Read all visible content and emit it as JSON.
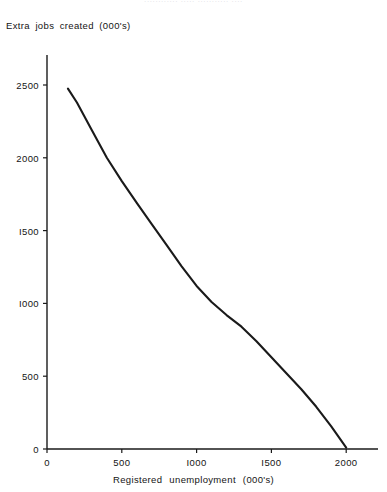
{
  "header": {
    "clipped_line": "............ ..... ........... ...."
  },
  "chart_data": {
    "type": "line",
    "title": "",
    "xlabel": "Registered   unemployment   (000's)",
    "ylabel": "Extra  jobs  created  (000's)",
    "xlim": [
      0,
      2200
    ],
    "ylim": [
      0,
      2600
    ],
    "grid": false,
    "legend": null,
    "xticks": [
      0,
      500,
      1000,
      1500,
      2000
    ],
    "xtick_labels": [
      "0",
      "500",
      "I000",
      "I500",
      "2000"
    ],
    "yticks": [
      0,
      500,
      1000,
      1500,
      2000,
      2500
    ],
    "ytick_labels": [
      "0",
      "500",
      "I000",
      "I500",
      "2000",
      "2500"
    ],
    "series": [
      {
        "name": "Extra jobs created vs registered unemployment",
        "color": "#1a1a1a",
        "x": [
          140,
          200,
          300,
          400,
          500,
          600,
          700,
          800,
          900,
          1000,
          1100,
          1200,
          1300,
          1400,
          1500,
          1600,
          1700,
          1800,
          1900,
          2000
        ],
        "y": [
          2475,
          2380,
          2190,
          2000,
          1840,
          1690,
          1545,
          1400,
          1255,
          1120,
          1010,
          920,
          840,
          740,
          630,
          520,
          410,
          290,
          155,
          10
        ]
      }
    ]
  },
  "axis_geometry": {
    "origin_x_px": 47,
    "origin_y_px": 449,
    "y_axis_top_px": 55,
    "x_axis_right_px": 378,
    "px_per_x_unit": 0.1496,
    "px_per_y_unit": 0.1456
  }
}
